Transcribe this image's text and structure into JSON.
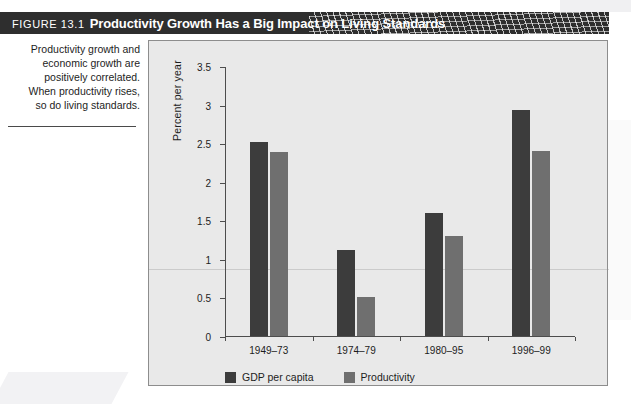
{
  "figure": {
    "number_label": "FIGURE 13.1",
    "title": "Productivity Growth Has a Big Impact on Living Standards",
    "caption": "Productivity growth and\neconomic growth are\npositively correlated.\nWhen productivity rises,\nso do living standards."
  },
  "colors": {
    "titlebar_background": "#2e2e2e",
    "panel_background": "#e9e9e9",
    "series_gdp": "#3c3c3c",
    "series_productivity": "#6f6f6f",
    "axis": "#4d4d4d"
  },
  "chart_data": {
    "type": "bar",
    "title": "Productivity Growth Has a Big Impact on Living Standards",
    "xlabel": "",
    "ylabel": "Percent per year",
    "categories": [
      "1949–73",
      "1974–79",
      "1980–95",
      "1996–99"
    ],
    "series": [
      {
        "name": "GDP per capita",
        "values": [
          2.52,
          1.12,
          1.6,
          2.93
        ]
      },
      {
        "name": "Productivity",
        "values": [
          2.39,
          0.51,
          1.3,
          2.4
        ]
      }
    ],
    "ylim": [
      0,
      3.5
    ],
    "yticks": [
      0,
      0.5,
      1,
      1.5,
      2,
      2.5,
      3,
      3.5
    ],
    "ytick_labels": [
      "0",
      "0.5",
      "1",
      "1.5",
      "2",
      "2.5",
      "3",
      "3.5"
    ],
    "grid": false,
    "legend_position": "bottom-left"
  }
}
